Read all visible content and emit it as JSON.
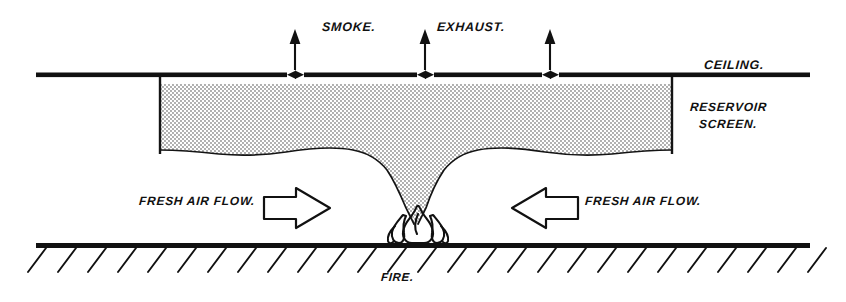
{
  "diagram": {
    "labels": {
      "smoke": "SMOKE.",
      "exhaust": "EXHAUST.",
      "ceiling": "CEILING.",
      "reservoir_line1": "RESERVOIR",
      "reservoir_line2": "SCREEN.",
      "fresh_air_flow_left": "FRESH AIR FLOW.",
      "fresh_air_flow_right": "FRESH AIR FLOW.",
      "fire": "FIRE."
    },
    "colors": {
      "ink": "#111111",
      "paper": "#ffffff",
      "stipple": "#4a4a4a"
    },
    "elements": {
      "ceiling_line": "ceiling-line",
      "floor_line": "floor-line",
      "floor_hatching": "floor-hatching",
      "smoke_layer": "smoke-reservoir-layer",
      "smoke_plume": "smoke-plume",
      "fire_flames": "fire-flames",
      "reservoir_screen_left": "reservoir-screen-left",
      "reservoir_screen_right": "reservoir-screen-right",
      "exhaust_vent_count": 3,
      "exhaust_arrow_count": 3,
      "airflow_arrow_left": "block-arrow-right",
      "airflow_arrow_right": "block-arrow-left"
    }
  }
}
